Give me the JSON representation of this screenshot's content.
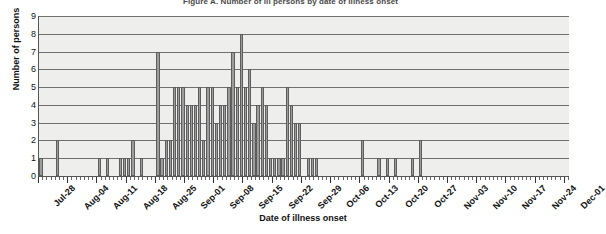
{
  "chart_data": {
    "type": "bar",
    "title": "Figure A. Number of ill persons by date of illness onset",
    "xlabel": "Date of illness onset",
    "ylabel": "Number of persons",
    "ylim": [
      0,
      9
    ],
    "ytick_labels": [
      "0",
      "1",
      "2",
      "3",
      "4",
      "5",
      "6",
      "7",
      "8",
      "9"
    ],
    "grid": true,
    "legend": "none",
    "bin": "daily",
    "x_start": "Jul-28",
    "x_end": "Dec-01",
    "xtick_labels": [
      "Jul-28",
      "Aug-04",
      "Aug-11",
      "Aug-18",
      "Aug-25",
      "Sep-01",
      "Sep-08",
      "Sep-15",
      "Sep-22",
      "Sep-29",
      "Oct-06",
      "Oct-13",
      "Oct-20",
      "Oct-27",
      "Nov-03",
      "Nov-10",
      "Nov-17",
      "Nov-24",
      "Dec-01"
    ],
    "xtick_day_offsets": [
      0,
      7,
      14,
      21,
      28,
      35,
      42,
      49,
      56,
      63,
      70,
      77,
      84,
      91,
      98,
      105,
      112,
      119,
      126
    ],
    "bar_color": "#9c9c9c",
    "bar_edge_color": "#5d5d5d",
    "plot_background": "#eeeeec",
    "categories": [
      "Jul-28",
      "Jul-29",
      "Jul-30",
      "Jul-31",
      "Aug-01",
      "Aug-02",
      "Aug-03",
      "Aug-04",
      "Aug-05",
      "Aug-06",
      "Aug-07",
      "Aug-08",
      "Aug-09",
      "Aug-10",
      "Aug-11",
      "Aug-12",
      "Aug-13",
      "Aug-14",
      "Aug-15",
      "Aug-16",
      "Aug-17",
      "Aug-18",
      "Aug-19",
      "Aug-20",
      "Aug-21",
      "Aug-22",
      "Aug-23",
      "Aug-24",
      "Aug-25",
      "Aug-26",
      "Aug-27",
      "Aug-28",
      "Aug-29",
      "Aug-30",
      "Aug-31",
      "Sep-01",
      "Sep-02",
      "Sep-03",
      "Sep-04",
      "Sep-05",
      "Sep-06",
      "Sep-07",
      "Sep-08",
      "Sep-09",
      "Sep-10",
      "Sep-11",
      "Sep-12",
      "Sep-13",
      "Sep-14",
      "Sep-15",
      "Sep-16",
      "Sep-17",
      "Sep-18",
      "Sep-19",
      "Sep-20",
      "Sep-21",
      "Sep-22",
      "Sep-23",
      "Sep-24",
      "Sep-25",
      "Sep-26",
      "Sep-27",
      "Sep-28",
      "Sep-29",
      "Sep-30",
      "Oct-01",
      "Oct-02",
      "Oct-03",
      "Oct-04",
      "Oct-05",
      "Oct-06",
      "Oct-07",
      "Oct-08",
      "Oct-09",
      "Oct-10",
      "Oct-11",
      "Oct-12",
      "Oct-13",
      "Oct-14",
      "Oct-15",
      "Oct-16",
      "Oct-17",
      "Oct-18",
      "Oct-19",
      "Oct-20",
      "Oct-21",
      "Oct-22",
      "Oct-23",
      "Oct-24",
      "Oct-25",
      "Oct-26",
      "Oct-27",
      "Oct-28",
      "Oct-29",
      "Oct-30",
      "Oct-31",
      "Nov-01",
      "Nov-02",
      "Nov-03",
      "Nov-04",
      "Nov-05",
      "Nov-06",
      "Nov-07",
      "Nov-08",
      "Nov-09",
      "Nov-10",
      "Nov-11",
      "Nov-12",
      "Nov-13",
      "Nov-14",
      "Nov-15",
      "Nov-16",
      "Nov-17",
      "Nov-18",
      "Nov-19",
      "Nov-20",
      "Nov-21",
      "Nov-22",
      "Nov-23",
      "Nov-24",
      "Nov-25",
      "Nov-26",
      "Nov-27",
      "Nov-28",
      "Nov-29",
      "Nov-30",
      "Dec-01"
    ],
    "values": [
      1,
      0,
      0,
      0,
      2,
      0,
      0,
      0,
      0,
      0,
      0,
      0,
      0,
      0,
      1,
      0,
      1,
      0,
      0,
      1,
      1,
      1,
      2,
      0,
      1,
      0,
      0,
      0,
      7,
      1,
      2,
      2,
      5,
      5,
      5,
      4,
      4,
      4,
      5,
      2,
      5,
      5,
      3,
      4,
      4,
      5,
      7,
      5,
      8,
      5,
      6,
      3,
      4,
      5,
      4,
      1,
      1,
      1,
      1,
      5,
      4,
      3,
      3,
      0,
      1,
      1,
      1,
      0,
      0,
      0,
      0,
      0,
      0,
      0,
      0,
      0,
      0,
      2,
      0,
      0,
      0,
      1,
      0,
      1,
      0,
      1,
      0,
      0,
      0,
      1,
      0,
      2,
      0,
      0,
      0,
      0,
      0,
      0,
      0,
      0,
      0,
      0,
      0,
      0,
      0,
      0,
      0,
      0,
      0,
      0,
      0,
      0,
      0,
      0,
      0,
      0,
      0,
      0,
      0,
      0,
      0,
      0,
      0,
      0,
      0,
      0,
      0
    ]
  }
}
